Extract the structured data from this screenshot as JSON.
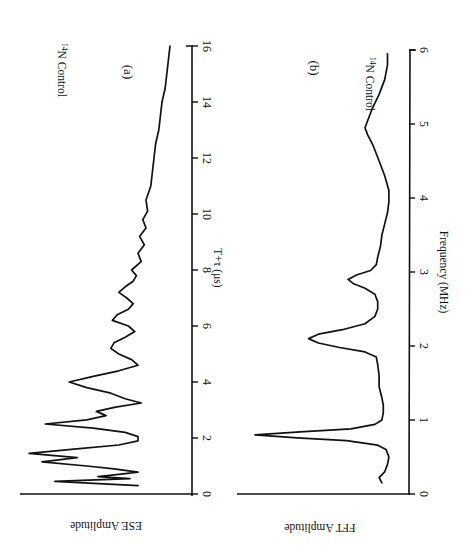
{
  "figure": {
    "orientation": "rotated 90 degrees clockwise",
    "ink_color": "#111111",
    "background": "#ffffff"
  },
  "chart_data": [
    {
      "type": "line",
      "panel": "(a)",
      "title": "",
      "annotation": "14N Control",
      "annotation_superscript": "14",
      "annotation_text": "N Control",
      "xlabel": "T+τ (μs)",
      "ylabel": "ESE Amplitude",
      "xlim": [
        0,
        16
      ],
      "xticks": [
        0,
        2,
        4,
        6,
        8,
        10,
        12,
        14,
        16
      ],
      "grid": false,
      "series": [
        {
          "name": "14N Control",
          "x": [
            0.3,
            0.45,
            0.55,
            0.62,
            0.7,
            0.78,
            0.9,
            1.0,
            1.15,
            1.3,
            1.45,
            1.6,
            1.75,
            1.9,
            2.05,
            2.2,
            2.35,
            2.5,
            2.65,
            2.8,
            2.95,
            3.1,
            3.25,
            3.4,
            3.6,
            3.8,
            4.0,
            4.2,
            4.4,
            4.6,
            4.8,
            5.0,
            5.2,
            5.4,
            5.6,
            5.8,
            6.0,
            6.2,
            6.4,
            6.6,
            6.8,
            7.0,
            7.2,
            7.4,
            7.6,
            7.8,
            8.0,
            8.3,
            8.6,
            8.9,
            9.2,
            9.5,
            9.8,
            10.1,
            10.5,
            11.0,
            11.5,
            12.0,
            12.5,
            13.0,
            13.5,
            14.0,
            14.5,
            15.0,
            15.5,
            16.0
          ],
          "y": [
            0.3,
            0.82,
            0.35,
            0.55,
            0.42,
            0.3,
            0.45,
            0.62,
            0.9,
            0.68,
            0.98,
            0.7,
            0.42,
            0.3,
            0.3,
            0.38,
            0.58,
            0.88,
            0.62,
            0.5,
            0.56,
            0.44,
            0.28,
            0.38,
            0.47,
            0.62,
            0.73,
            0.58,
            0.42,
            0.3,
            0.34,
            0.42,
            0.47,
            0.45,
            0.38,
            0.32,
            0.36,
            0.46,
            0.43,
            0.36,
            0.33,
            0.37,
            0.42,
            0.38,
            0.33,
            0.31,
            0.34,
            0.28,
            0.3,
            0.26,
            0.29,
            0.25,
            0.27,
            0.24,
            0.25,
            0.22,
            0.21,
            0.2,
            0.19,
            0.17,
            0.16,
            0.15,
            0.13,
            0.12,
            0.11,
            0.1
          ]
        }
      ]
    },
    {
      "type": "line",
      "panel": "(b)",
      "title": "",
      "annotation": "14N Control",
      "annotation_superscript": "14",
      "annotation_text": "N Control",
      "xlabel": "Frequency (MHz)",
      "ylabel": "FFT Amplitude",
      "xlim": [
        0,
        6
      ],
      "xticks": [
        0,
        1,
        2,
        3,
        4,
        5,
        6
      ],
      "grid": false,
      "series": [
        {
          "name": "14N Control",
          "x": [
            0.15,
            0.22,
            0.3,
            0.4,
            0.5,
            0.6,
            0.66,
            0.72,
            0.76,
            0.8,
            0.84,
            0.88,
            0.94,
            1.0,
            1.1,
            1.2,
            1.3,
            1.45,
            1.6,
            1.75,
            1.85,
            1.92,
            1.98,
            2.04,
            2.1,
            2.16,
            2.22,
            2.3,
            2.4,
            2.5,
            2.6,
            2.7,
            2.78,
            2.84,
            2.9,
            2.96,
            3.02,
            3.1,
            3.2,
            3.35,
            3.5,
            3.65,
            3.8,
            3.95,
            4.1,
            4.3,
            4.5,
            4.7,
            4.85,
            4.95,
            5.05,
            5.2,
            5.4,
            5.6,
            5.8,
            5.95
          ],
          "y": [
            0.1,
            0.12,
            0.08,
            0.06,
            0.05,
            0.07,
            0.13,
            0.35,
            0.7,
            1.0,
            0.68,
            0.32,
            0.15,
            0.1,
            0.09,
            0.09,
            0.1,
            0.12,
            0.12,
            0.13,
            0.14,
            0.22,
            0.4,
            0.55,
            0.62,
            0.55,
            0.38,
            0.22,
            0.15,
            0.13,
            0.13,
            0.15,
            0.22,
            0.3,
            0.34,
            0.28,
            0.18,
            0.14,
            0.13,
            0.11,
            0.1,
            0.08,
            0.06,
            0.05,
            0.05,
            0.08,
            0.12,
            0.16,
            0.2,
            0.22,
            0.2,
            0.17,
            0.12,
            0.08,
            0.06,
            0.06
          ]
        }
      ]
    }
  ],
  "panels": {
    "a": {
      "label": "(a)",
      "annotation_sup": "14",
      "annotation_text": "N Control",
      "xlabel": "T+τ (μs)",
      "ylabel": "ESE Amplitude",
      "ticks": [
        "0",
        "2",
        "4",
        "6",
        "8",
        "10",
        "12",
        "14",
        "16"
      ]
    },
    "b": {
      "label": "(b)",
      "annotation_sup": "14",
      "annotation_text": "N Control",
      "xlabel": "Frequency (MHz)",
      "ylabel": "FFT Amplitude",
      "ticks": [
        "0",
        "1",
        "2",
        "3",
        "4",
        "5",
        "6"
      ]
    }
  }
}
